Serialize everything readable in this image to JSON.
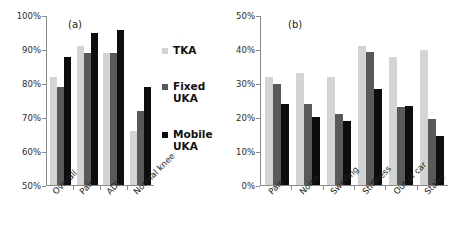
{
  "figure": {
    "panel_a_tag": "(a)",
    "panel_b_tag": "(b)"
  },
  "legend": {
    "items": [
      {
        "label": "TKA",
        "color": "#d4d4d4"
      },
      {
        "label": "Fixed UKA",
        "color": "#595959"
      },
      {
        "label": "Mobile UKA",
        "color": "#0d0d0d"
      }
    ]
  },
  "chart_data": [
    {
      "type": "bar",
      "title": "(a)",
      "xlabel": "",
      "ylabel": "",
      "ylim": [
        50,
        100
      ],
      "ytick_labels": [
        "100%",
        "90%",
        "80%",
        "70%",
        "60%",
        "50%"
      ],
      "ytick_values": [
        100,
        90,
        80,
        70,
        60,
        50
      ],
      "grid": false,
      "legend_position": "right",
      "categories": [
        "Overall",
        "Pain",
        "ADL",
        "Normal knee"
      ],
      "series": [
        {
          "name": "TKA",
          "color": "#d4d4d4",
          "values": [
            82,
            91,
            89,
            66
          ]
        },
        {
          "name": "Fixed UKA",
          "color": "#595959",
          "values": [
            79,
            89,
            89,
            72
          ]
        },
        {
          "name": "Mobile UKA",
          "color": "#0d0d0d",
          "values": [
            88,
            95,
            96,
            79
          ]
        }
      ]
    },
    {
      "type": "bar",
      "title": "(b)",
      "xlabel": "",
      "ylabel": "",
      "ylim": [
        0,
        50
      ],
      "ytick_labels": [
        "50%",
        "40%",
        "30%",
        "20%",
        "10%",
        "0%"
      ],
      "ytick_values": [
        50,
        40,
        30,
        20,
        10,
        0
      ],
      "grid": false,
      "legend_position": "none",
      "categories": [
        "Pain",
        "Noise",
        "Swelling",
        "Stiffness",
        "Out of car",
        "Stairs"
      ],
      "series": [
        {
          "name": "TKA",
          "color": "#d4d4d4",
          "values": [
            32,
            33,
            32,
            41,
            38,
            40
          ]
        },
        {
          "name": "Fixed UKA",
          "color": "#595959",
          "values": [
            30,
            24,
            21,
            39.5,
            23,
            19.5
          ]
        },
        {
          "name": "Mobile UKA",
          "color": "#0d0d0d",
          "values": [
            24,
            20,
            19,
            28.5,
            23.5,
            14.5
          ]
        }
      ]
    }
  ]
}
